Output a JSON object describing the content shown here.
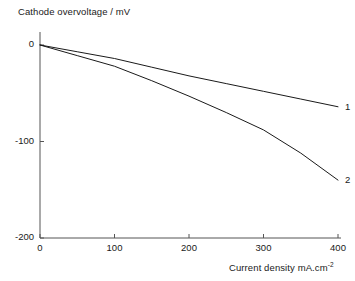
{
  "chart_data": {
    "type": "line",
    "title": "",
    "xlabel": "Current density  mA.cm",
    "xlabel_sup": "-2",
    "ylabel": "Cathode overvoltage / mV",
    "xlim": [
      0,
      400
    ],
    "ylim": [
      -200,
      0
    ],
    "grid": false,
    "legend_position": "right-end-of-line",
    "x_ticks": [
      "0",
      "100",
      "200",
      "300",
      "400"
    ],
    "x_tick_values": [
      0,
      100,
      200,
      300,
      400
    ],
    "y_ticks": [
      "0",
      "-100",
      "-200"
    ],
    "y_tick_values": [
      0,
      -100,
      -200
    ],
    "x": [
      0,
      50,
      100,
      150,
      200,
      250,
      300,
      350,
      400
    ],
    "series": [
      {
        "name": "1",
        "label": "1",
        "color": "#1a1a1a",
        "values": [
          0,
          -7,
          -14,
          -23,
          -32,
          -40,
          -48,
          -56,
          -64
        ]
      },
      {
        "name": "2",
        "label": "2",
        "color": "#1a1a1a",
        "values": [
          0,
          -11,
          -22,
          -37,
          -53,
          -70,
          -88,
          -112,
          -140
        ]
      }
    ]
  },
  "axes": {
    "axis_color": "#555555",
    "line_color": "#1a1a1a"
  }
}
